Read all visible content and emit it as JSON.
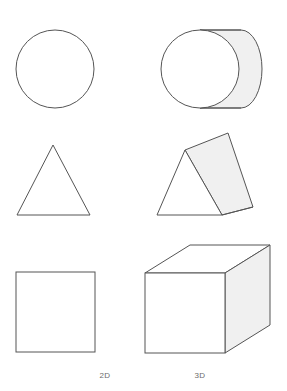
{
  "figure": {
    "background_color": "#ffffff",
    "stroke_color": "#555555",
    "fill_color": "#ffffff",
    "shade_color": "#f0f0f0",
    "columns": [
      {
        "key": "2d",
        "label": "2D"
      },
      {
        "key": "3d",
        "label": "3D"
      }
    ],
    "rows": [
      {
        "shape_2d": "circle",
        "shape_3d": "cylinder",
        "circle": {
          "cx": 55,
          "cy": 69,
          "r": 39
        },
        "cylinder": {
          "front_cx": 200,
          "front_cy": 69,
          "front_r": 39,
          "depth_x": 62,
          "top_y": 30,
          "bottom_y": 108,
          "cap_rx": 21
        }
      },
      {
        "shape_2d": "triangle",
        "shape_3d": "triangular-prism",
        "triangle": {
          "apex_x": 53,
          "apex_y": 145,
          "left_x": 17,
          "right_x": 90,
          "base_y": 215
        },
        "prism": {
          "front_apex_x": 185,
          "front_apex_y": 150,
          "front_left_x": 157,
          "front_right_x": 222,
          "front_base_y": 215,
          "back_apex_x": 228,
          "back_apex_y": 133,
          "back_right_x": 253,
          "back_right_y": 207
        }
      },
      {
        "shape_2d": "square",
        "shape_3d": "cube",
        "square": {
          "x": 16,
          "y": 272,
          "w": 79,
          "h": 80
        },
        "cube": {
          "front_x": 145,
          "front_y": 273,
          "front_w": 80,
          "front_h": 80,
          "offset_x": 45,
          "offset_y": -28
        }
      }
    ]
  }
}
